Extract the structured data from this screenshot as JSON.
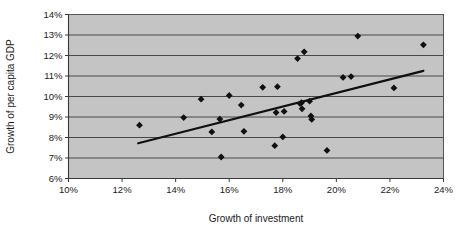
{
  "chart_data": {
    "type": "scatter",
    "title": "",
    "xlabel": "Growth of investment",
    "ylabel": "Growth of per capita GDP",
    "xlim": [
      10,
      24
    ],
    "ylim": [
      6,
      14
    ],
    "xticks": [
      "10%",
      "12%",
      "14%",
      "16%",
      "18%",
      "20%",
      "22%",
      "24%"
    ],
    "xtick_values": [
      10,
      12,
      14,
      16,
      18,
      20,
      22,
      24
    ],
    "yticks": [
      "6%",
      "7%",
      "8%",
      "9%",
      "10%",
      "11%",
      "12%",
      "13%",
      "14%"
    ],
    "ytick_values": [
      6,
      7,
      8,
      9,
      10,
      11,
      12,
      13,
      14
    ],
    "grid": "horizontal",
    "legend": "none",
    "plot_background": "#c4c4c4",
    "marker_color": "#101010",
    "marker_shape": "diamond",
    "trendline_color": "#101010",
    "series": [
      {
        "name": "Countries",
        "points": [
          [
            12.65,
            8.6
          ],
          [
            14.3,
            8.97
          ],
          [
            14.95,
            9.87
          ],
          [
            15.35,
            8.27
          ],
          [
            15.65,
            8.9
          ],
          [
            15.7,
            7.05
          ],
          [
            16.0,
            10.05
          ],
          [
            16.45,
            9.58
          ],
          [
            16.55,
            8.3
          ],
          [
            17.25,
            10.45
          ],
          [
            17.7,
            7.6
          ],
          [
            17.75,
            9.22
          ],
          [
            17.8,
            10.48
          ],
          [
            18.0,
            8.03
          ],
          [
            18.05,
            9.27
          ],
          [
            18.55,
            11.85
          ],
          [
            18.65,
            9.65
          ],
          [
            18.7,
            9.7
          ],
          [
            18.72,
            9.4
          ],
          [
            18.8,
            12.18
          ],
          [
            19.0,
            9.77
          ],
          [
            19.05,
            9.05
          ],
          [
            19.08,
            8.88
          ],
          [
            19.65,
            7.37
          ],
          [
            20.25,
            10.93
          ],
          [
            20.55,
            10.97
          ],
          [
            20.8,
            12.95
          ],
          [
            22.15,
            10.42
          ],
          [
            23.25,
            12.52
          ]
        ]
      }
    ],
    "trendline": {
      "name": "Linear trendline",
      "x_start": 12.6,
      "y_start": 7.72,
      "x_end": 23.25,
      "y_end": 11.25
    }
  }
}
